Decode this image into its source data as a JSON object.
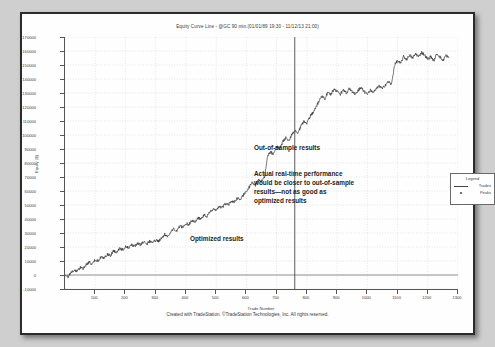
{
  "document": {
    "footer": "Created with TradeStation. ©TradeStation Technologies, Inc. All rights reserved."
  },
  "legend": {
    "title": "Legend",
    "items": [
      {
        "label": "Trades",
        "marker": "line-icon"
      },
      {
        "label": "Peaks",
        "marker": "dot-icon"
      }
    ]
  },
  "annotations": {
    "optimized": "Optimized results",
    "out_of_sample_title": "Out-of-sample results",
    "out_of_sample_body": "Actual real-time performance\nwould be closer to out-of-sample\nresults—not as good as\noptimized results"
  },
  "chart_data": {
    "type": "line",
    "title": "Equity Curve Line - @GC 90 min.(01/01/89 19:30 - 11/12/13 21:00)",
    "xlabel": "Trade Number",
    "ylabel": "Equity ($)",
    "xlim": [
      0,
      1300
    ],
    "ylim": [
      -10000,
      170000
    ],
    "grid": true,
    "legend_position": "right",
    "xticks": [
      100,
      200,
      300,
      400,
      500,
      600,
      700,
      800,
      900,
      1000,
      1100,
      1200,
      1300
    ],
    "yticks": [
      170000,
      160000,
      150000,
      140000,
      130000,
      120000,
      110000,
      100000,
      90000,
      80000,
      70000,
      60000,
      50000,
      40000,
      30000,
      20000,
      10000,
      0,
      -10000
    ],
    "divider_x": 760,
    "zero_line": 0,
    "series": [
      {
        "name": "Trades",
        "x": [
          0,
          10,
          20,
          30,
          40,
          50,
          60,
          70,
          80,
          90,
          100,
          110,
          120,
          130,
          140,
          150,
          160,
          170,
          180,
          190,
          200,
          210,
          220,
          230,
          240,
          250,
          260,
          270,
          280,
          290,
          300,
          310,
          320,
          330,
          340,
          350,
          360,
          370,
          380,
          390,
          400,
          410,
          420,
          430,
          440,
          450,
          460,
          470,
          480,
          490,
          500,
          510,
          520,
          530,
          540,
          550,
          560,
          570,
          580,
          590,
          600,
          610,
          620,
          630,
          640,
          650,
          660,
          670,
          680,
          690,
          700,
          710,
          720,
          730,
          740,
          750,
          760,
          770,
          780,
          790,
          800,
          810,
          820,
          830,
          840,
          850,
          860,
          870,
          880,
          890,
          900,
          910,
          920,
          930,
          940,
          950,
          960,
          970,
          980,
          990,
          1000,
          1010,
          1020,
          1030,
          1040,
          1050,
          1060,
          1070,
          1080,
          1090,
          1100,
          1110,
          1120,
          1130,
          1140,
          1150,
          1160,
          1170,
          1180,
          1190,
          1200,
          1210,
          1220,
          1230,
          1240,
          1250,
          1260,
          1270
        ],
        "values": [
          0,
          -1500,
          1500,
          3500,
          2500,
          5500,
          4500,
          7500,
          9000,
          8000,
          11000,
          10000,
          13000,
          12000,
          15000,
          14000,
          17000,
          16500,
          19000,
          18000,
          20000,
          19500,
          21500,
          20500,
          22500,
          21500,
          23500,
          22000,
          24000,
          23000,
          25000,
          24000,
          26500,
          29000,
          27500,
          31000,
          33000,
          31500,
          35000,
          34000,
          37000,
          36000,
          39000,
          38000,
          41000,
          40000,
          43000,
          42000,
          45000,
          47000,
          46000,
          49000,
          48000,
          51000,
          50000,
          53000,
          52000,
          55000,
          54000,
          57000,
          60000,
          63000,
          66000,
          64000,
          68000,
          67000,
          70000,
          85000,
          88000,
          86000,
          92000,
          90000,
          95000,
          98000,
          96000,
          100000,
          103000,
          101000,
          106000,
          110000,
          108000,
          113000,
          116000,
          120000,
          124000,
          128000,
          126000,
          131000,
          129000,
          133000,
          131000,
          129000,
          132000,
          130000,
          133000,
          131000,
          129000,
          132000,
          134000,
          131000,
          129000,
          132000,
          130000,
          133000,
          135000,
          133000,
          136000,
          138000,
          136000,
          150000,
          153000,
          151000,
          156000,
          154000,
          157000,
          155000,
          158000,
          156000,
          159000,
          157000,
          154000,
          156000,
          153000,
          158000,
          156000,
          153000,
          157000,
          155000
        ]
      }
    ]
  }
}
